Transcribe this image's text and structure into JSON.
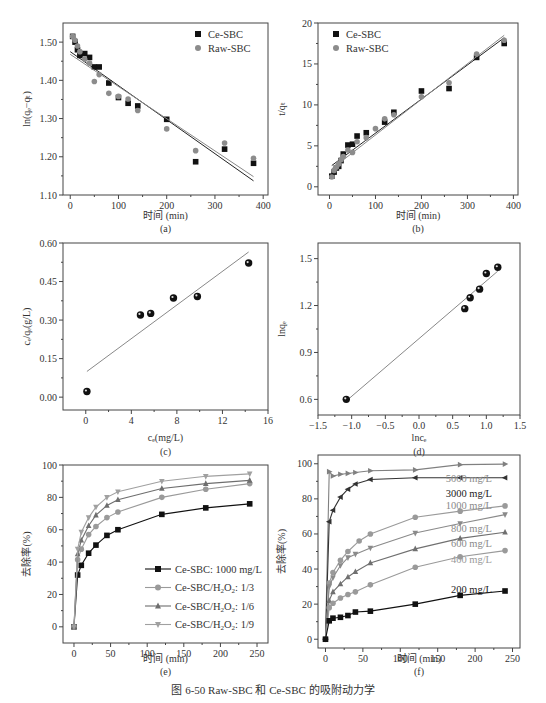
{
  "figure_caption": "图 6-50   Raw-SBC 和 Ce-SBC 的吸附动力学",
  "chart_data": [
    {
      "panel": "(a)",
      "type": "scatter",
      "title": "",
      "xlabel": "时间 (min)",
      "ylabel": "ln(qe−qt)",
      "xlim": [
        -15,
        410
      ],
      "ylim": [
        1.1,
        1.55
      ],
      "xticks": [
        0,
        100,
        200,
        300,
        400
      ],
      "yticks": [
        1.1,
        1.2,
        1.3,
        1.4,
        1.5
      ],
      "legend": {
        "position": "upper right",
        "entries": [
          "Ce-SBC",
          "Raw-SBC"
        ]
      },
      "series": [
        {
          "name": "Ce-SBC",
          "marker": "square",
          "color": "#111111",
          "x": [
            5,
            10,
            15,
            20,
            30,
            40,
            50,
            60,
            80,
            100,
            120,
            140,
            200,
            260,
            320,
            380
          ],
          "y": [
            1.515,
            1.5,
            1.48,
            1.465,
            1.47,
            1.46,
            1.435,
            1.435,
            1.393,
            1.355,
            1.34,
            1.333,
            1.298,
            1.187,
            1.22,
            1.183
          ],
          "fit": {
            "x": [
              0,
              380
            ],
            "y": [
              1.475,
              1.137
            ]
          }
        },
        {
          "name": "Raw-SBC",
          "marker": "circle",
          "color": "#8c8c8c",
          "x": [
            5,
            10,
            15,
            20,
            30,
            40,
            50,
            60,
            80,
            100,
            120,
            140,
            200,
            260,
            320,
            380
          ],
          "y": [
            1.515,
            1.505,
            1.49,
            1.475,
            1.455,
            1.445,
            1.397,
            1.415,
            1.366,
            1.358,
            1.351,
            1.321,
            1.273,
            1.216,
            1.236,
            1.196
          ],
          "fit": {
            "x": [
              0,
              380
            ],
            "y": [
              1.468,
              1.148
            ]
          }
        }
      ]
    },
    {
      "panel": "(b)",
      "type": "scatter",
      "title": "",
      "xlabel": "时间 (min)",
      "ylabel": "t/qt",
      "xlim": [
        -25,
        410
      ],
      "ylim": [
        -1,
        20
      ],
      "xticks": [
        0,
        100,
        200,
        300,
        400
      ],
      "yticks": [
        0,
        5,
        10,
        15,
        20
      ],
      "legend": {
        "position": "upper left",
        "entries": [
          "Ce-SBC",
          "Raw-SBC"
        ]
      },
      "series": [
        {
          "name": "Ce-SBC",
          "marker": "square",
          "color": "#111111",
          "x": [
            5,
            10,
            15,
            20,
            25,
            30,
            40,
            50,
            60,
            80,
            120,
            140,
            200,
            260,
            320,
            380
          ],
          "y": [
            1.3,
            1.8,
            2.3,
            2.5,
            3.2,
            4.0,
            5.1,
            5.2,
            6.2,
            6.6,
            7.9,
            9.1,
            11.7,
            12.0,
            15.8,
            17.5
          ],
          "fit": {
            "x": [
              5,
              380
            ],
            "y": [
              2.6,
              18.2
            ]
          }
        },
        {
          "name": "Raw-SBC",
          "marker": "circle",
          "color": "#8c8c8c",
          "x": [
            5,
            10,
            15,
            20,
            25,
            30,
            40,
            50,
            60,
            80,
            100,
            120,
            140,
            200,
            260,
            320,
            380
          ],
          "y": [
            1.2,
            2.0,
            2.4,
            2.8,
            3.3,
            3.7,
            4.5,
            4.2,
            5.5,
            6.0,
            7.1,
            8.3,
            8.8,
            11.0,
            12.7,
            16.2,
            17.9
          ],
          "fit": {
            "x": [
              5,
              380
            ],
            "y": [
              2.2,
              18.5
            ]
          }
        }
      ]
    },
    {
      "panel": "(c)",
      "type": "scatter",
      "title": "",
      "xlabel": "ce(mg/L)",
      "ylabel": "ce/qe(g/L)",
      "xlim": [
        -2,
        16
      ],
      "ylim": [
        -0.05,
        0.6
      ],
      "xticks": [
        0,
        4,
        8,
        12,
        16
      ],
      "yticks": [
        0.0,
        0.15,
        0.3,
        0.45,
        0.6
      ],
      "series": [
        {
          "name": "data",
          "marker": "sphere",
          "color": "#111111",
          "x": [
            0.1,
            4.8,
            5.7,
            7.7,
            9.8,
            14.3
          ],
          "y": [
            0.022,
            0.32,
            0.326,
            0.386,
            0.392,
            0.522
          ],
          "fit": {
            "x": [
              0.1,
              14.3
            ],
            "y": [
              0.1,
              0.565
            ]
          }
        }
      ]
    },
    {
      "panel": "(d)",
      "type": "scatter",
      "title": "",
      "xlabel": "lnce",
      "ylabel": "lnqe",
      "xlim": [
        -1.5,
        1.5
      ],
      "ylim": [
        0.5,
        1.6
      ],
      "xticks": [
        -1.5,
        -1.0,
        -0.5,
        0.0,
        0.5,
        1.0,
        1.5
      ],
      "yticks": [
        0.6,
        0.9,
        1.2,
        1.5
      ],
      "series": [
        {
          "name": "data",
          "marker": "sphere",
          "color": "#111111",
          "x": [
            -1.08,
            0.68,
            0.76,
            0.9,
            1.0,
            1.17
          ],
          "y": [
            0.6,
            1.18,
            1.25,
            1.305,
            1.405,
            1.445
          ],
          "fit": {
            "x": [
              -1.08,
              1.17
            ],
            "y": [
              0.59,
              1.42
            ]
          }
        }
      ]
    },
    {
      "panel": "(e)",
      "type": "line",
      "title": "",
      "xlabel": "时间 (min)",
      "ylabel": "去除率(%)",
      "xlim": [
        -15,
        265
      ],
      "ylim": [
        -10,
        100
      ],
      "xticks": [
        0,
        50,
        100,
        150,
        200,
        250
      ],
      "yticks": [
        0,
        20,
        40,
        60,
        80,
        100
      ],
      "legend": {
        "position": "lower right",
        "entries": [
          "Ce-SBC: 1000 mg/L",
          "Ce-SBC/H2O2: 1/3",
          "Ce-SBC/H2O2: 1/6",
          "Ce-SBC/H2O2: 1/9"
        ]
      },
      "x": [
        0,
        5,
        10,
        20,
        30,
        45,
        60,
        120,
        180,
        240
      ],
      "series": [
        {
          "name": "Ce-SBC: 1000 mg/L",
          "marker": "square",
          "color": "#111111",
          "values": [
            0,
            32,
            38,
            45.5,
            50.5,
            56.5,
            60,
            69.5,
            73.5,
            76
          ]
        },
        {
          "name": "Ce-SBC/H2O2: 1/3",
          "marker": "circle",
          "color": "#9a9a9a",
          "values": [
            0,
            41.5,
            48,
            57,
            62,
            67.5,
            71,
            80,
            85,
            88.5
          ]
        },
        {
          "name": "Ce-SBC/H2O2: 1/6",
          "marker": "triangle-up",
          "color": "#6e6e6e",
          "values": [
            0,
            45,
            53.5,
            62.5,
            69,
            75,
            78.5,
            85.5,
            88.5,
            90.5
          ]
        },
        {
          "name": "Ce-SBC/H2O2: 1/9",
          "marker": "triangle-down",
          "color": "#a0a0a0",
          "values": [
            0,
            48,
            58.5,
            67.5,
            74,
            80,
            83.5,
            90,
            93,
            94.5
          ]
        }
      ]
    },
    {
      "panel": "(f)",
      "type": "line",
      "title": "",
      "xlabel": "时间 (min)",
      "ylabel": "去除率(%)",
      "xlim": [
        -10,
        260
      ],
      "ylim": [
        -5,
        105
      ],
      "xticks": [
        0,
        50,
        100,
        150,
        200,
        250
      ],
      "yticks": [
        0,
        20,
        40,
        60,
        80,
        100
      ],
      "annotations": [
        "5000 mg/L",
        "3000 mg/L",
        "1000 mg/L",
        "800 mg/L",
        "600 mg/L",
        "400 mg/L",
        "200 mg/L"
      ],
      "series": [
        {
          "name": "5000 mg/L",
          "marker": "triangle-right",
          "color": "#808080",
          "x": [
            0,
            5,
            10,
            20,
            30,
            40,
            60,
            120,
            180,
            240
          ],
          "values": [
            0,
            95.5,
            93,
            94,
            94.5,
            95,
            96,
            96.5,
            99.5,
            99.8
          ]
        },
        {
          "name": "3000 mg/L",
          "marker": "triangle-left",
          "color": "#333333",
          "x": [
            0,
            5,
            10,
            20,
            30,
            40,
            60,
            120,
            180,
            240
          ],
          "values": [
            0,
            67,
            73.5,
            81,
            85.5,
            88.5,
            91,
            92,
            92,
            92
          ]
        },
        {
          "name": "1000 mg/L",
          "marker": "diamond",
          "color": "#9a9a9a",
          "x": [
            0,
            5,
            10,
            20,
            30,
            45,
            60,
            120,
            180,
            240
          ],
          "values": [
            0,
            32,
            38,
            45,
            50,
            56,
            60,
            69.5,
            73,
            76
          ]
        },
        {
          "name": "800 mg/L",
          "marker": "triangle-down",
          "color": "#8a8a8a",
          "x": [
            0,
            5,
            10,
            20,
            30,
            40,
            60,
            120,
            180,
            240
          ],
          "values": [
            0,
            30,
            35,
            42,
            46.5,
            48.5,
            52,
            60.5,
            66,
            71
          ]
        },
        {
          "name": "600 mg/L",
          "marker": "triangle-up",
          "color": "#707070",
          "x": [
            0,
            5,
            10,
            20,
            30,
            40,
            60,
            120,
            180,
            240
          ],
          "values": [
            0,
            22,
            27,
            31.5,
            35.5,
            38.5,
            43.5,
            51.5,
            57.5,
            61
          ]
        },
        {
          "name": "400 mg/L",
          "marker": "circle",
          "color": "#9a9a9a",
          "x": [
            0,
            5,
            10,
            20,
            30,
            40,
            60,
            120,
            180,
            240
          ],
          "values": [
            0,
            18,
            20.5,
            23.5,
            25.5,
            27,
            31,
            41,
            47,
            50.5
          ]
        },
        {
          "name": "200 mg/L",
          "marker": "square",
          "color": "#111111",
          "x": [
            0,
            5,
            10,
            20,
            30,
            40,
            60,
            120,
            180,
            240
          ],
          "values": [
            0,
            10.5,
            12,
            12.5,
            13.5,
            15.5,
            16,
            20,
            25,
            27.5
          ]
        }
      ]
    }
  ],
  "panels": {
    "a": {
      "caption": "(a)",
      "xlabel": "时间 (min)",
      "ylabel": "ln(qₑ−qₜ)"
    },
    "b": {
      "caption": "(b)",
      "xlabel": "时间 (min)",
      "ylabel": "t/qₜ"
    },
    "c": {
      "caption": "(c)",
      "xlabel": "cₑ(mg/L)",
      "ylabel": "cₑ/qₑ(g/L)"
    },
    "d": {
      "caption": "(d)",
      "xlabel": "lncₑ",
      "ylabel": "lnqₑ"
    },
    "e": {
      "caption": "(e)",
      "xlabel": "时间 (min)",
      "ylabel": "去除率(%)"
    },
    "f": {
      "caption": "(f)",
      "xlabel": "时间 (min)",
      "ylabel": "去除率(%)"
    }
  }
}
